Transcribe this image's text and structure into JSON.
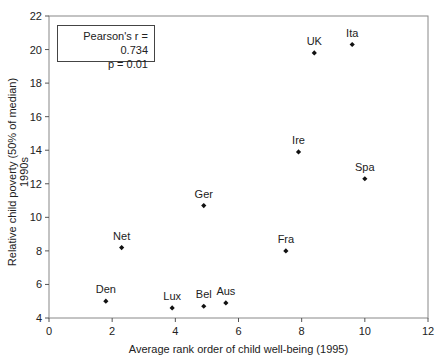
{
  "chart_data": {
    "type": "scatter",
    "title": "",
    "xlabel": "Average rank order of child well-being (1995)",
    "ylabel": "Relative child poverty (50% of median) 1990s",
    "xlim": [
      0,
      12
    ],
    "ylim": [
      4,
      22
    ],
    "xticks": [
      0,
      2,
      4,
      6,
      8,
      10,
      12
    ],
    "yticks": [
      4,
      6,
      8,
      10,
      12,
      14,
      16,
      18,
      20,
      22
    ],
    "grid": false,
    "points": [
      {
        "label": "Den",
        "x": 1.8,
        "y": 5.0
      },
      {
        "label": "Net",
        "x": 2.3,
        "y": 8.2
      },
      {
        "label": "Lux",
        "x": 3.9,
        "y": 4.6
      },
      {
        "label": "Bel",
        "x": 4.9,
        "y": 4.7
      },
      {
        "label": "Aus",
        "x": 5.6,
        "y": 4.9
      },
      {
        "label": "Ger",
        "x": 4.9,
        "y": 10.7
      },
      {
        "label": "Fra",
        "x": 7.5,
        "y": 8.0
      },
      {
        "label": "Ire",
        "x": 7.9,
        "y": 13.9
      },
      {
        "label": "Spa",
        "x": 10.0,
        "y": 12.3
      },
      {
        "label": "UK",
        "x": 8.4,
        "y": 19.8
      },
      {
        "label": "Ita",
        "x": 9.6,
        "y": 20.3
      }
    ],
    "annotation": {
      "line1": "Pearson's r = 0.734",
      "line2": "p = 0.01"
    }
  }
}
